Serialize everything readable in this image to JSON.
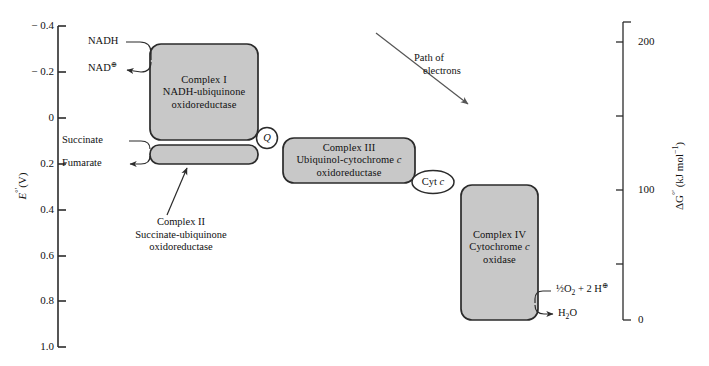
{
  "left_axis": {
    "title": "E°′(V)",
    "ticks": [
      "− 0.4",
      "− 0.2",
      "0",
      "0.2",
      "0.4",
      "0.6",
      "0.8",
      "1.0"
    ]
  },
  "right_axis": {
    "title": "ΔG°′ (kJ mol⁻¹)",
    "ticks": [
      "200",
      "100",
      "0"
    ]
  },
  "complexes": {
    "complex1": {
      "line1": "Complex I",
      "line2": "NADH-ubiquinone",
      "line3": "oxidoreductase"
    },
    "complex2": {
      "line1": "Complex II",
      "line2": "Succinate-ubiquinone",
      "line3": "oxidoreductase"
    },
    "complex3": {
      "line1": "Complex III",
      "line2_a": "Ubiquinol-cytochrome ",
      "line2_b": "c",
      "line3": "oxidoreductase"
    },
    "complex4": {
      "line1": "Complex IV",
      "line2_a": "Cytochrome ",
      "line2_b": "c",
      "line3": "oxidase"
    }
  },
  "carriers": {
    "q": "Q",
    "cytc_a": "Cyt ",
    "cytc_b": "c"
  },
  "substrates": {
    "nadh": "NADH",
    "nad": "NAD",
    "nad_charge": "⊕",
    "succinate": "Succinate",
    "fumarate": "Fumarate",
    "oxygen_a": "½",
    "oxygen_b": "O",
    "oxygen_sub": "2",
    "oxygen_c": " + 2 H",
    "oxygen_charge": "⊕",
    "water_a": "H",
    "water_sub": "2",
    "water_b": "O"
  },
  "annotation": {
    "path_line1": "Path of",
    "path_line2": "electrons"
  },
  "colors": {
    "box_fill": "#c8c8c8",
    "box_stroke": "#2b2b2b",
    "axis": "#2b2b2b",
    "text": "#111111",
    "page": "#ffffff"
  }
}
